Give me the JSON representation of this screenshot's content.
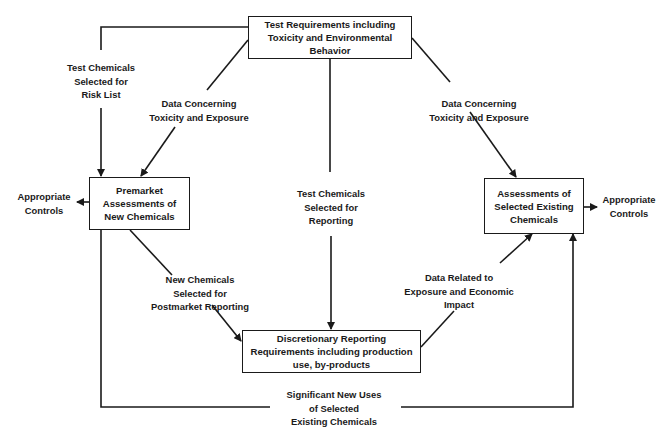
{
  "diagram": {
    "nodes": {
      "test_requirements": [
        "Test Requirements including",
        "Toxicity and Environmental",
        "Behavior"
      ],
      "premarket": [
        "Premarket",
        "Assessments of",
        "New Chemicals"
      ],
      "assessments_existing": [
        "Assessments of",
        "Selected Existing",
        "Chemicals"
      ],
      "discretionary": [
        "Discretionary Reporting",
        "Requirements including production",
        "use, by-products"
      ]
    },
    "edge_labels": {
      "risk_list": [
        "Test Chemicals",
        "Selected for",
        "Risk List"
      ],
      "data_left": [
        "Data Concerning",
        "Toxicity and Exposure"
      ],
      "data_right": [
        "Data Concerning",
        "Toxicity and Exposure"
      ],
      "reporting": [
        "Test Chemicals",
        "Selected for",
        "Reporting"
      ],
      "postmarket": [
        "New Chemicals",
        "Selected for",
        "Postmarket Reporting"
      ],
      "economic": [
        "Data Related to",
        "Exposure and Economic",
        "Impact"
      ],
      "new_uses": [
        "Significant New Uses",
        "of Selected",
        "Existing Chemicals"
      ],
      "controls_left": [
        "Appropriate",
        "Controls"
      ],
      "controls_right": [
        "Appropriate",
        "Controls"
      ]
    },
    "line_color": "#1a1a1a"
  }
}
